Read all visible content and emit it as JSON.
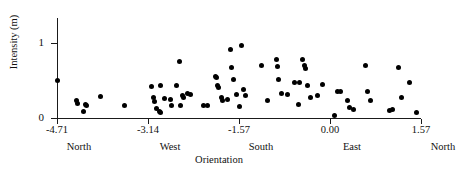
{
  "chart_data": {
    "type": "scatter",
    "title": "",
    "xlabel": "Orientation",
    "ylabel": "Intensity  (m)",
    "xlim": [
      -4.71,
      1.57
    ],
    "ylim": [
      0,
      1.33
    ],
    "grid": false,
    "legend": null,
    "xticks": [
      -4.71,
      -3.14,
      -1.57,
      0.0,
      1.57
    ],
    "xticklabels": [
      "-4.71",
      "-3.14",
      "-1.57",
      "0.00",
      "1.57"
    ],
    "xtick_direction_labels": [
      "North",
      "West",
      "South",
      "East",
      "North"
    ],
    "yticks": [
      0,
      1
    ],
    "yticklabels": [
      "0",
      "1"
    ],
    "marker": "filled-circle",
    "marker_color": "#000000",
    "points": [
      {
        "x": -4.71,
        "y": 0.5
      },
      {
        "x": -4.37,
        "y": 0.24
      },
      {
        "x": -4.35,
        "y": 0.19
      },
      {
        "x": -4.26,
        "y": 0.09
      },
      {
        "x": -4.22,
        "y": 0.18
      },
      {
        "x": -4.2,
        "y": 0.17
      },
      {
        "x": -3.96,
        "y": 0.29
      },
      {
        "x": -3.54,
        "y": 0.17
      },
      {
        "x": -3.08,
        "y": 0.42
      },
      {
        "x": -3.05,
        "y": 0.27
      },
      {
        "x": -3.02,
        "y": 0.22
      },
      {
        "x": -3.0,
        "y": 0.13
      },
      {
        "x": -2.95,
        "y": 0.09
      },
      {
        "x": -2.93,
        "y": 0.43
      },
      {
        "x": -2.92,
        "y": 0.07
      },
      {
        "x": -2.86,
        "y": 0.26
      },
      {
        "x": -2.76,
        "y": 0.25
      },
      {
        "x": -2.73,
        "y": 0.17
      },
      {
        "x": -2.64,
        "y": 0.43
      },
      {
        "x": -2.59,
        "y": 0.75
      },
      {
        "x": -2.58,
        "y": 0.17
      },
      {
        "x": -2.54,
        "y": 0.3
      },
      {
        "x": -2.52,
        "y": 0.27
      },
      {
        "x": -2.46,
        "y": 0.33
      },
      {
        "x": -2.41,
        "y": 0.32
      },
      {
        "x": -2.18,
        "y": 0.17
      },
      {
        "x": -2.11,
        "y": 0.17
      },
      {
        "x": -1.98,
        "y": 0.56
      },
      {
        "x": -1.96,
        "y": 0.54
      },
      {
        "x": -1.94,
        "y": 0.43
      },
      {
        "x": -1.92,
        "y": 0.41
      },
      {
        "x": -1.88,
        "y": 0.28
      },
      {
        "x": -1.85,
        "y": 0.24
      },
      {
        "x": -1.77,
        "y": 0.25
      },
      {
        "x": -1.72,
        "y": 0.92
      },
      {
        "x": -1.7,
        "y": 0.68
      },
      {
        "x": -1.66,
        "y": 0.51
      },
      {
        "x": -1.62,
        "y": 0.31
      },
      {
        "x": -1.57,
        "y": 0.16
      },
      {
        "x": -1.52,
        "y": 0.97
      },
      {
        "x": -1.49,
        "y": 0.38
      },
      {
        "x": -1.46,
        "y": 0.3
      },
      {
        "x": -1.18,
        "y": 0.7
      },
      {
        "x": -1.07,
        "y": 0.24
      },
      {
        "x": -0.93,
        "y": 0.78
      },
      {
        "x": -0.91,
        "y": 0.69
      },
      {
        "x": -0.88,
        "y": 0.52
      },
      {
        "x": -0.84,
        "y": 0.33
      },
      {
        "x": -0.74,
        "y": 0.31
      },
      {
        "x": -0.62,
        "y": 0.47
      },
      {
        "x": -0.55,
        "y": 0.18
      },
      {
        "x": -0.52,
        "y": 0.47
      },
      {
        "x": -0.47,
        "y": 0.78
      },
      {
        "x": -0.44,
        "y": 0.7
      },
      {
        "x": -0.42,
        "y": 0.66
      },
      {
        "x": -0.38,
        "y": 0.44
      },
      {
        "x": -0.33,
        "y": 0.27
      },
      {
        "x": -0.22,
        "y": 0.3
      },
      {
        "x": -0.13,
        "y": 0.45
      },
      {
        "x": 0.07,
        "y": 0.03
      },
      {
        "x": 0.13,
        "y": 0.36
      },
      {
        "x": 0.18,
        "y": 0.35
      },
      {
        "x": 0.31,
        "y": 0.23
      },
      {
        "x": 0.34,
        "y": 0.14
      },
      {
        "x": 0.41,
        "y": 0.11
      },
      {
        "x": 0.62,
        "y": 0.7
      },
      {
        "x": 0.64,
        "y": 0.36
      },
      {
        "x": 0.7,
        "y": 0.24
      },
      {
        "x": 1.02,
        "y": 0.1
      },
      {
        "x": 1.08,
        "y": 0.12
      },
      {
        "x": 1.18,
        "y": 0.67
      },
      {
        "x": 1.24,
        "y": 0.27
      },
      {
        "x": 1.38,
        "y": 0.47
      },
      {
        "x": 1.5,
        "y": 0.07
      }
    ]
  },
  "axis": {
    "y_title": "Intensity  (m)",
    "x_title": "Orientation"
  }
}
